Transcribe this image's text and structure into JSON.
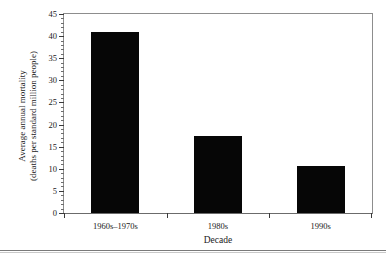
{
  "chart_data": {
    "type": "bar",
    "title": "",
    "subtitle": "",
    "xlabel": "Decade",
    "ylabel_line1": "Average annual mortality",
    "ylabel_line2": "(deaths per standard million people)",
    "categories": [
      "1960s–1970s",
      "1980s",
      "1990s"
    ],
    "values": [
      41,
      17.5,
      10.7
    ],
    "ylim": [
      0,
      45
    ],
    "ytick_labels": [
      "0",
      "5",
      "10",
      "15",
      "20",
      "25",
      "30",
      "35",
      "40",
      "45"
    ],
    "ytick_values": [
      0,
      5,
      10,
      15,
      20,
      25,
      30,
      35,
      40,
      45
    ],
    "ytick_minor_step": 1,
    "grid": false,
    "legend": null,
    "bar_color": "#060606",
    "axis_color": "#3a3a3a",
    "frame_color": "#8d8d8d"
  }
}
